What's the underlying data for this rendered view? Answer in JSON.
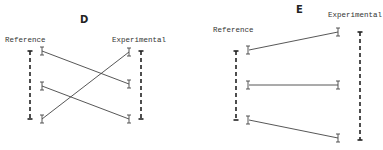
{
  "panels": [
    {
      "id": "D",
      "title": "D",
      "left_label": "Reference",
      "right_label": "Experimental"
    },
    {
      "id": "E",
      "title": "E",
      "left_label": "Reference",
      "right_label": "Experimental"
    }
  ],
  "colors": {
    "line": "#333333",
    "dashed": "#222222"
  }
}
